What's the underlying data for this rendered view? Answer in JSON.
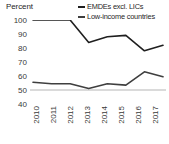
{
  "axis": {
    "y_title": "Percent",
    "y_ticks": [
      "100",
      "90",
      "80",
      "70",
      "60",
      "50",
      "40"
    ],
    "x_ticks": [
      "2010",
      "2011",
      "2012",
      "2013",
      "2014",
      "2015",
      "2016",
      "2017"
    ]
  },
  "legend": {
    "items": [
      {
        "label": "EMDEs excl. LICs",
        "color": "#1f1f1f"
      },
      {
        "label": "Low-income countries",
        "color": "#3f3f3f"
      }
    ]
  },
  "chart_data": {
    "type": "line",
    "title": "",
    "subtitle": "",
    "xlabel": "",
    "ylabel": "Percent",
    "categories": [
      "2010",
      "2011",
      "2012",
      "2013",
      "2014",
      "2015",
      "2016",
      "2017"
    ],
    "ylim": [
      40,
      100
    ],
    "ytick_step": 10,
    "grid": false,
    "legend_position": "top-right",
    "reference_line": {
      "value": 50,
      "color": "#b5b5b5"
    },
    "series": [
      {
        "name": "EMDEs excl. LICs",
        "color": "#1f1f1f",
        "values": [
          100,
          100,
          100,
          84,
          88,
          89,
          78,
          82
        ]
      },
      {
        "name": "Low-income countries",
        "color": "#3f3f3f",
        "values": [
          55.5,
          54.5,
          54.5,
          51,
          54.5,
          53.5,
          63,
          59.5
        ]
      }
    ]
  }
}
